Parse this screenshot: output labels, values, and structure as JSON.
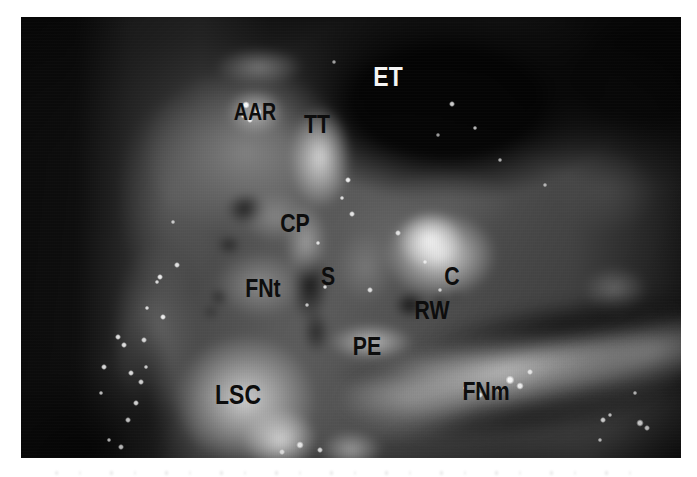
{
  "figure": {
    "kind": "middle-ear dissection photograph",
    "labels": [
      {
        "id": "et",
        "text": "ET",
        "tone": "light"
      },
      {
        "id": "aar",
        "text": "AAR",
        "tone": "dark"
      },
      {
        "id": "tt",
        "text": "TT",
        "tone": "dark"
      },
      {
        "id": "cp",
        "text": "CP",
        "tone": "dark"
      },
      {
        "id": "fnt",
        "text": "FNt",
        "tone": "dark"
      },
      {
        "id": "s",
        "text": "S",
        "tone": "dark"
      },
      {
        "id": "c",
        "text": "C",
        "tone": "dark"
      },
      {
        "id": "rw",
        "text": "RW",
        "tone": "dark"
      },
      {
        "id": "pe",
        "text": "PE",
        "tone": "dark"
      },
      {
        "id": "lsc",
        "text": "LSC",
        "tone": "dark"
      },
      {
        "id": "fnm",
        "text": "FNm",
        "tone": "dark"
      }
    ],
    "colors": {
      "page_background": "#ffffff",
      "photo_base": "#4f4f4f",
      "label_dark": "#0d0d0d",
      "label_light": "#f5f5f5"
    }
  }
}
